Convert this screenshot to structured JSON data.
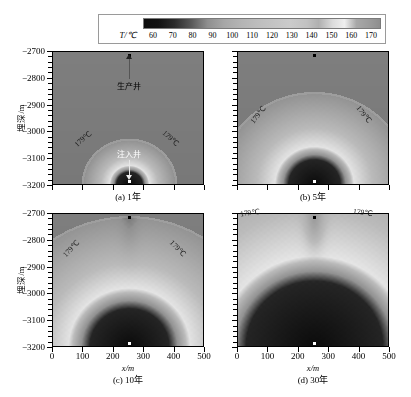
{
  "colorbar": {
    "name": "temperature-colorbar",
    "axis_label": "T/℃",
    "ticks": [
      60,
      70,
      80,
      90,
      100,
      110,
      120,
      130,
      140,
      150,
      160,
      170
    ],
    "min": 60,
    "max": 170,
    "colormap": "grayscale",
    "low_color": "#0d0d0d",
    "high_color": "#efefef"
  },
  "axes": {
    "x_title": "x/m",
    "y_title": "埋深/m",
    "x_ticks": [
      0,
      100,
      200,
      300,
      400,
      500
    ],
    "y_ticks": [
      -2700,
      -2800,
      -2900,
      -3000,
      -3100,
      -3200
    ],
    "xlim": [
      0,
      500
    ],
    "ylim": [
      -3200,
      -2700
    ]
  },
  "panels": [
    {
      "id": "a",
      "caption": "(a) 1年",
      "years": 1,
      "show_y_axis": true,
      "show_x_axis": false,
      "contour_labels": [
        {
          "text": "179℃",
          "color": "dark"
        },
        {
          "text": "179℃",
          "color": "dark"
        }
      ],
      "annotations": [
        {
          "name": "production-well",
          "text": "生产井",
          "x": 250,
          "y": -2700,
          "color": "dark"
        },
        {
          "name": "injection-well",
          "text": "注入井",
          "x": 250,
          "y": -3180,
          "color": "white"
        }
      ]
    },
    {
      "id": "b",
      "caption": "(b) 5年",
      "years": 5,
      "show_y_axis": false,
      "show_x_axis": false,
      "contour_labels": [
        {
          "text": "179℃",
          "color": "dark"
        },
        {
          "text": "179℃",
          "color": "dark"
        }
      ],
      "annotations": [
        {
          "name": "production-well",
          "x": 250,
          "y": -2700,
          "color": "dark"
        },
        {
          "name": "injection-well",
          "x": 250,
          "y": -3180,
          "color": "white"
        }
      ]
    },
    {
      "id": "c",
      "caption": "(c) 10年",
      "years": 10,
      "show_y_axis": true,
      "show_x_axis": true,
      "contour_labels": [
        {
          "text": "179℃",
          "color": "dark"
        },
        {
          "text": "179℃",
          "color": "dark"
        }
      ],
      "annotations": [
        {
          "name": "production-well",
          "x": 250,
          "y": -2700,
          "color": "dark"
        },
        {
          "name": "injection-well",
          "x": 250,
          "y": -3180,
          "color": "white"
        }
      ]
    },
    {
      "id": "d",
      "caption": "(d) 30年",
      "years": 30,
      "show_y_axis": false,
      "show_x_axis": true,
      "contour_labels": [
        {
          "text": "179℃",
          "color": "dark"
        },
        {
          "text": "179℃",
          "color": "dark"
        }
      ],
      "annotations": [
        {
          "name": "production-well",
          "x": 250,
          "y": -2700,
          "color": "dark"
        },
        {
          "name": "injection-well",
          "x": 250,
          "y": -3180,
          "color": "white"
        }
      ]
    }
  ],
  "chart_data": {
    "type": "heatmap",
    "title": "",
    "xlabel": "x/m",
    "ylabel": "埋深/m",
    "xlim": [
      0,
      500
    ],
    "ylim": [
      -3200,
      -2700
    ],
    "colorbar_label": "T/℃",
    "colorbar_ticks": [
      60,
      70,
      80,
      90,
      100,
      110,
      120,
      130,
      140,
      150,
      160,
      170
    ],
    "value_range": [
      60,
      170
    ],
    "grid": false,
    "legend_position": "top",
    "panel_variable": "time",
    "panel_values": [
      1,
      5,
      10,
      30
    ],
    "panel_unit": "年",
    "panel_captions": [
      "(a) 1年",
      "(b) 5年",
      "(c) 10年",
      "(d) 30年"
    ],
    "annotation_contour": "179℃",
    "wells": [
      {
        "name": "生产井",
        "role": "production",
        "x": 250,
        "depth": -2700
      },
      {
        "name": "注入井",
        "role": "injection",
        "x": 250,
        "depth": -3180
      }
    ],
    "series": [
      {
        "name": "179℃ front apex depth (m)",
        "x": [
          1,
          5,
          10,
          30
        ],
        "values": [
          -2990,
          -2830,
          -2720,
          -2700
        ]
      },
      {
        "name": "179℃ front half-width at -3200 m (m)",
        "x": [
          1,
          5,
          10,
          30
        ],
        "values": [
          130,
          215,
          250,
          250
        ]
      },
      {
        "name": "cooled zone (<100℃) radius near injector (m)",
        "x": [
          1,
          5,
          10,
          30
        ],
        "values": [
          45,
          90,
          135,
          230
        ]
      }
    ]
  }
}
